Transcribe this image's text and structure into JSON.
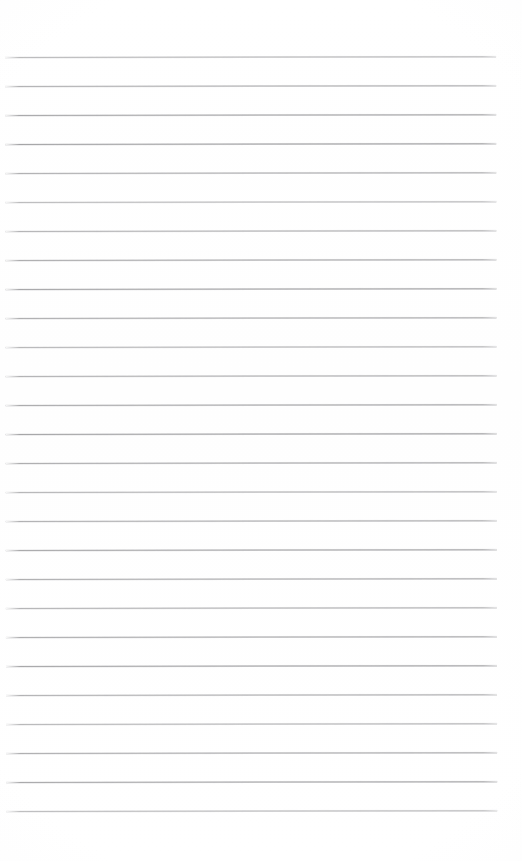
{
  "document": {
    "kind": "scanned-ruled-paper",
    "title": "",
    "content_text": "",
    "page_width": 522,
    "page_height": 861,
    "background_color": "#ffffff"
  },
  "ruling": {
    "line_color": "#a0a0a2",
    "line_thickness": 1,
    "line_count": 27,
    "line_spacing": 29,
    "first_line_y": 57,
    "last_line_y": 811,
    "line_start_x": 5,
    "line_end_x": 496,
    "top_margin": 57,
    "bottom_margin": 46,
    "left_margin": 5,
    "right_margin": 26,
    "tilt_degrees": -0.085,
    "margin_rule": "none",
    "lines": [
      {
        "index": 1,
        "y": 57,
        "opacity": 0.72
      },
      {
        "index": 2,
        "y": 86,
        "opacity": 0.8
      },
      {
        "index": 3,
        "y": 115,
        "opacity": 0.9
      },
      {
        "index": 4,
        "y": 144,
        "opacity": 0.95
      },
      {
        "index": 5,
        "y": 173,
        "opacity": 0.82
      },
      {
        "index": 6,
        "y": 202,
        "opacity": 0.7
      },
      {
        "index": 7,
        "y": 231,
        "opacity": 0.78
      },
      {
        "index": 8,
        "y": 260,
        "opacity": 0.86
      },
      {
        "index": 9,
        "y": 289,
        "opacity": 0.92
      },
      {
        "index": 10,
        "y": 318,
        "opacity": 0.84
      },
      {
        "index": 11,
        "y": 347,
        "opacity": 0.74
      },
      {
        "index": 12,
        "y": 376,
        "opacity": 0.8
      },
      {
        "index": 13,
        "y": 405,
        "opacity": 0.88
      },
      {
        "index": 14,
        "y": 434,
        "opacity": 0.94
      },
      {
        "index": 15,
        "y": 463,
        "opacity": 0.86
      },
      {
        "index": 16,
        "y": 492,
        "opacity": 0.76
      },
      {
        "index": 17,
        "y": 521,
        "opacity": 0.82
      },
      {
        "index": 18,
        "y": 550,
        "opacity": 0.9
      },
      {
        "index": 19,
        "y": 579,
        "opacity": 0.84
      },
      {
        "index": 20,
        "y": 608,
        "opacity": 0.78
      },
      {
        "index": 21,
        "y": 637,
        "opacity": 0.86
      },
      {
        "index": 22,
        "y": 666,
        "opacity": 0.92
      },
      {
        "index": 23,
        "y": 695,
        "opacity": 0.8
      },
      {
        "index": 24,
        "y": 724,
        "opacity": 0.74
      },
      {
        "index": 25,
        "y": 753,
        "opacity": 0.84
      },
      {
        "index": 26,
        "y": 782,
        "opacity": 0.9
      },
      {
        "index": 27,
        "y": 811,
        "opacity": 0.7
      }
    ]
  }
}
